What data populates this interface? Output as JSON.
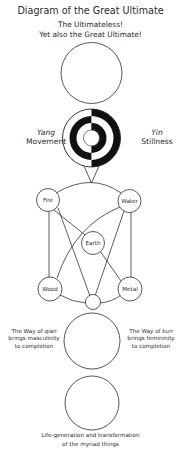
{
  "title": "Diagram of the Great Ultimate",
  "wuji": {
    "line1": "The Ultimateless!",
    "line2": "Yet also the Great Ultimate!"
  },
  "yinyang": {
    "left": {
      "name": "Yang",
      "label": "Movement"
    },
    "right": {
      "name": "Yin",
      "label": "Stillness"
    }
  },
  "five_phases": {
    "fire": "Fire",
    "water": "Water",
    "earth": "Earth",
    "wood": "Wood",
    "metal": "Metal"
  },
  "qian_kun": {
    "left": {
      "line1_pre": "The Way of ",
      "line1_it": "qian",
      "line2": "brings masculinity",
      "line3": "to completion"
    },
    "right": {
      "line1_pre": "The Way of ",
      "line1_it": "kun",
      "line2": "brings femininity",
      "line3": "to completion"
    }
  },
  "myriad": {
    "line1": "Life-generation and transformation",
    "line2": "of the myriad things"
  },
  "colors": {
    "stroke": "#2a2a2a",
    "fill_black": "#111111",
    "background": "#ffffff"
  }
}
